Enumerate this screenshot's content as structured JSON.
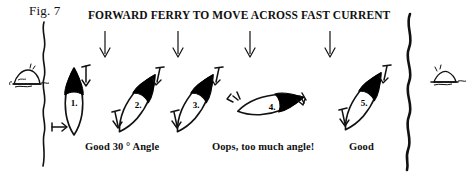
{
  "figure": {
    "label": "Fig. 7",
    "headline": "FORWARD FERRY TO MOVE ACROSS FAST CURRENT"
  },
  "captions": {
    "good30": "Good 30 ° Angle",
    "oops": "Oops, too much angle!",
    "good": "Good"
  },
  "boats": [
    {
      "number": "1.",
      "angle_deg": 0,
      "position": "left bank, bow upstream, zero ferry angle"
    },
    {
      "number": "2.",
      "angle_deg": 30,
      "position": "ferry angle 30 degrees"
    },
    {
      "number": "3.",
      "angle_deg": 30,
      "position": "ferry angle 30 degrees"
    },
    {
      "number": "4.",
      "angle_deg": 75,
      "position": "ferry angle far too large, nearly broadside"
    },
    {
      "number": "5.",
      "angle_deg": 30,
      "position": "ferry angle 30 degrees, near right bank"
    }
  ],
  "current_arrows": {
    "count": 4,
    "direction": "down",
    "meaning": "fast current flowing downstream"
  },
  "banks": {
    "left": "wavy shoreline on left",
    "right": "wavy shoreline on right"
  },
  "rocks": {
    "left": "rock-bush sketch on left bank",
    "right": "rock sketch on right bank"
  },
  "colors": {
    "ink": "#111111",
    "paper": "#ffffff",
    "hull_fill": "#ffffff",
    "bow_fill": "#000000"
  }
}
